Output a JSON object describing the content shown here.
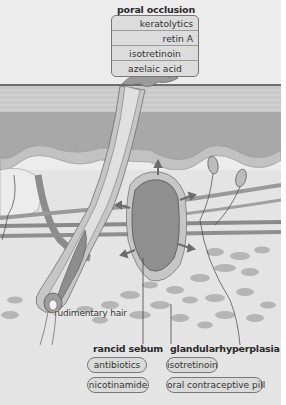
{
  "poral_occlusion": {
    "heading": "poral occlusion",
    "treatments": [
      "keratolytics",
      "retin A",
      "isotretinoin",
      "azelaic acid"
    ]
  },
  "rancid_sebum": {
    "heading": "rancid sebum",
    "treatments": [
      "antibiotics",
      "nicotinamide"
    ]
  },
  "glandular_hyperplasia": {
    "heading": "glandularhyperplasia",
    "treatments": [
      "isotretinoin",
      "oral contraceptive pill"
    ]
  },
  "labels": {
    "rudimentary_hair": "rudimentary hair"
  },
  "colors": {
    "background": "#ececec",
    "epidermis": "#bdbdbd",
    "dermis_dark": "#a9a9a9",
    "gland_fill": "#8f8f8f",
    "box_fill": "#dcdcdc",
    "box_border": "#777777"
  }
}
